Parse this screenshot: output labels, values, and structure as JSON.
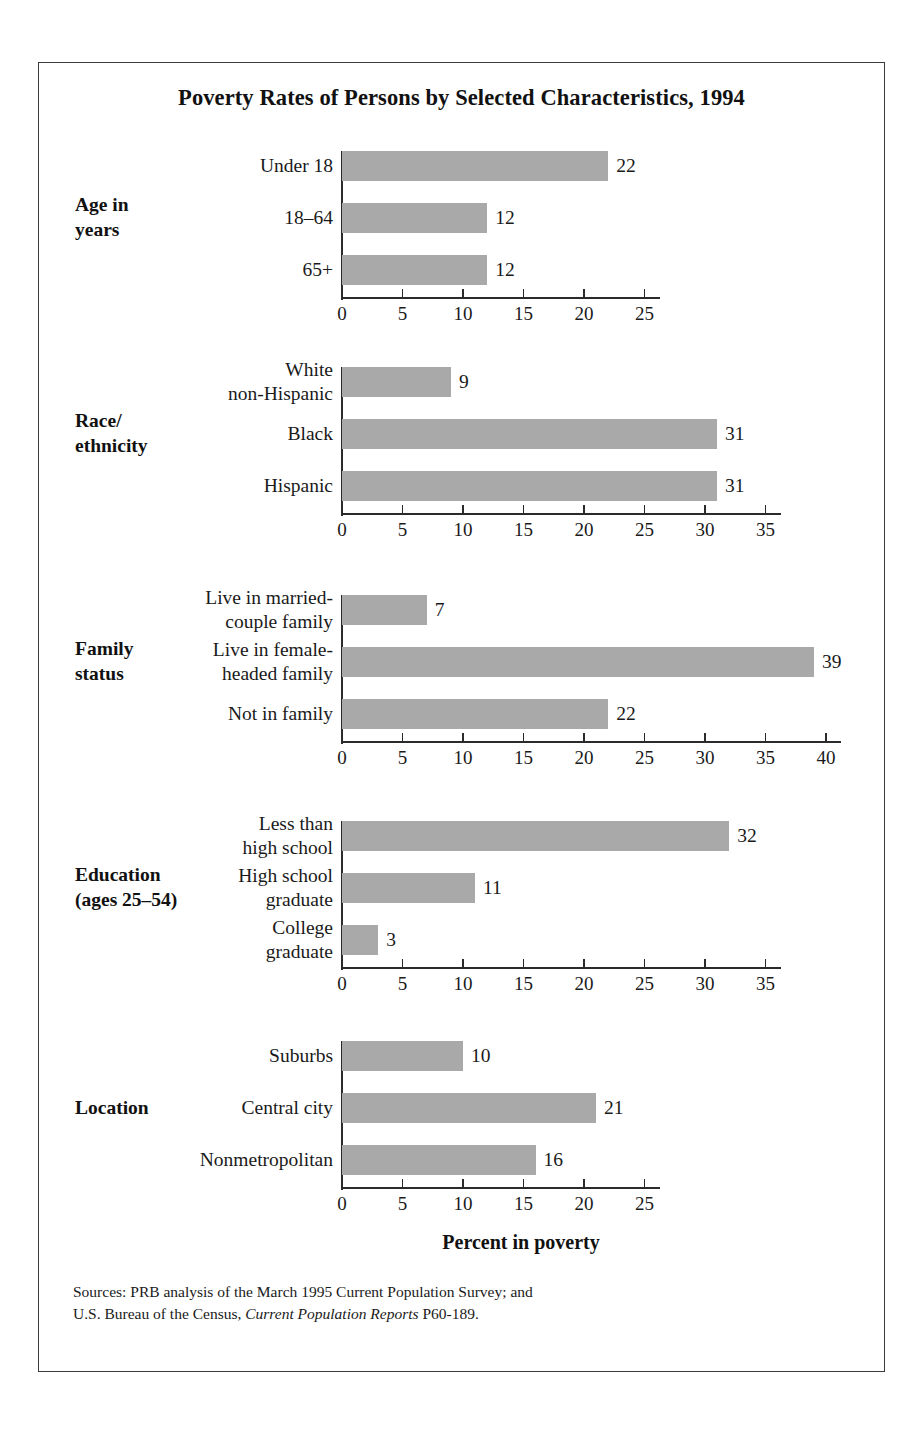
{
  "figure": {
    "title": "Poverty Rates of Persons by Selected Characteristics, 1994",
    "axis_title": "Percent in poverty",
    "sources_line1": "Sources: PRB analysis of the March 1995 Current Population Survey; and",
    "sources_line2_pre": "U.S. Bureau of the Census, ",
    "sources_line2_italic": "Current Population Reports",
    "sources_line2_post": " P60-189.",
    "bar_color": "#a9a9a9",
    "axis_color": "#2b2b2b",
    "frame_color": "#3a3a3a"
  },
  "chart_data": {
    "type": "bar",
    "orientation": "horizontal",
    "title": "Poverty Rates of Persons by Selected Characteristics, 1994",
    "xlabel": "Percent in poverty",
    "ylabel": "",
    "grid": false,
    "legend": "none",
    "panels": [
      {
        "group": "Age in\nyears",
        "group_lines": [
          "Age in",
          "years"
        ],
        "categories": [
          "Under 18",
          "18–64",
          "65+"
        ],
        "category_lines": [
          [
            "Under 18"
          ],
          [
            "18–64"
          ],
          [
            "65+"
          ]
        ],
        "values": [
          22,
          12,
          12
        ],
        "xlim": [
          0,
          25
        ],
        "xticks": [
          0,
          5,
          10,
          15,
          20,
          25
        ]
      },
      {
        "group": "Race/\nethnicity",
        "group_lines": [
          "Race/",
          "ethnicity"
        ],
        "categories": [
          "White non-Hispanic",
          "Black",
          "Hispanic"
        ],
        "category_lines": [
          [
            "White",
            "non-Hispanic"
          ],
          [
            "Black"
          ],
          [
            "Hispanic"
          ]
        ],
        "values": [
          9,
          31,
          31
        ],
        "xlim": [
          0,
          35
        ],
        "xticks": [
          0,
          5,
          10,
          15,
          20,
          25,
          30,
          35
        ]
      },
      {
        "group": "Family\nstatus",
        "group_lines": [
          "Family",
          "status"
        ],
        "categories": [
          "Live in married-couple family",
          "Live in female-headed family",
          "Not in family"
        ],
        "category_lines": [
          [
            "Live in married-",
            "couple family"
          ],
          [
            "Live in female-",
            "headed family"
          ],
          [
            "Not in family"
          ]
        ],
        "values": [
          7,
          39,
          22
        ],
        "xlim": [
          0,
          40
        ],
        "xticks": [
          0,
          5,
          10,
          15,
          20,
          25,
          30,
          35,
          40
        ]
      },
      {
        "group": "Education\n(ages 25–54)",
        "group_lines": [
          "Education",
          "(ages 25–54)"
        ],
        "categories": [
          "Less than high school",
          "High school graduate",
          "College graduate"
        ],
        "category_lines": [
          [
            "Less than",
            "high school"
          ],
          [
            "High school",
            "graduate"
          ],
          [
            "College",
            "graduate"
          ]
        ],
        "values": [
          32,
          11,
          3
        ],
        "xlim": [
          0,
          35
        ],
        "xticks": [
          0,
          5,
          10,
          15,
          20,
          25,
          30,
          35
        ]
      },
      {
        "group": "Location",
        "group_lines": [
          "Location"
        ],
        "categories": [
          "Suburbs",
          "Central city",
          "Nonmetropolitan"
        ],
        "category_lines": [
          [
            "Suburbs"
          ],
          [
            "Central city"
          ],
          [
            "Nonmetropolitan"
          ]
        ],
        "values": [
          10,
          21,
          16
        ],
        "xlim": [
          0,
          25
        ],
        "xticks": [
          0,
          5,
          10,
          15,
          20,
          25
        ]
      }
    ]
  }
}
